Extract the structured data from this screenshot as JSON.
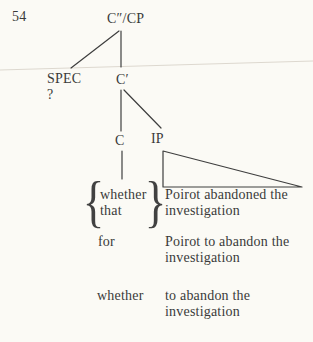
{
  "page": {
    "number": "54"
  },
  "tree": {
    "root_label": "C″/CP",
    "spec_label": "SPEC",
    "spec_value": "?",
    "cbar_label": "C′",
    "c_label": "C",
    "ip_label": "IP"
  },
  "examples": {
    "left_brace": "{",
    "right_brace": "}",
    "rows": [
      {
        "comp_line1": "whether",
        "comp_line2": "that",
        "ip": "Poirot abandoned the\ninvestigation"
      },
      {
        "comp": "for",
        "ip": "Poirot to abandon the\ninvestigation"
      },
      {
        "comp": "whether",
        "ip": "to abandon the\ninvestigation"
      }
    ]
  },
  "colors": {
    "ink": "#3a3a3a",
    "paper": "#fbfaf5",
    "line": "#3e3e3e"
  }
}
